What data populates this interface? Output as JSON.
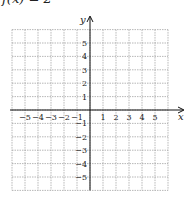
{
  "title": "f(x) = 2",
  "axes": {
    "x_label": "x",
    "y_label": "y",
    "x_ticks": [
      "-5",
      "-4",
      "-3",
      "-2",
      "-1",
      "1",
      "2",
      "3",
      "4",
      "5"
    ],
    "y_ticks": [
      "5",
      "4",
      "3",
      "2",
      "1",
      "-1",
      "-2",
      "-3",
      "-4",
      "-5"
    ]
  },
  "grid": {
    "x_range": [
      -6,
      6
    ],
    "y_range": [
      -6,
      6
    ],
    "style": "dotted",
    "color": "#9a9a9a"
  },
  "colors": {
    "axis": "#111111",
    "label": "#222222"
  }
}
